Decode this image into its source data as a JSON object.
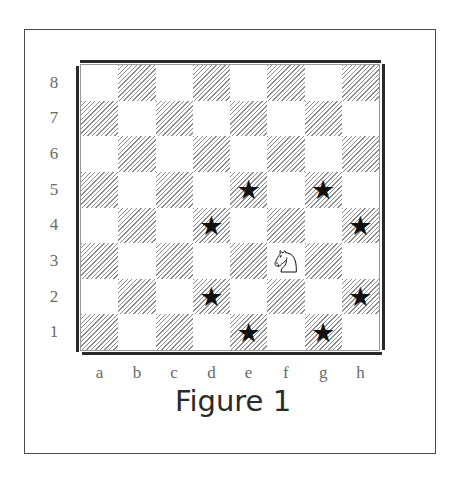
{
  "diagram": {
    "type": "chessboard",
    "caption": "Figure 1",
    "ranks": [
      "8",
      "7",
      "6",
      "5",
      "4",
      "3",
      "2",
      "1"
    ],
    "files": [
      "a",
      "b",
      "c",
      "d",
      "e",
      "f",
      "g",
      "h"
    ],
    "pieces": [
      {
        "square": "f3",
        "piece": "knight",
        "color": "white",
        "glyph": "knight-icon"
      }
    ],
    "markers": [
      {
        "square": "e5",
        "symbol": "★"
      },
      {
        "square": "g5",
        "symbol": "★"
      },
      {
        "square": "d4",
        "symbol": "★"
      },
      {
        "square": "h4",
        "symbol": "★"
      },
      {
        "square": "d2",
        "symbol": "★"
      },
      {
        "square": "h2",
        "symbol": "★"
      },
      {
        "square": "e1",
        "symbol": "★"
      },
      {
        "square": "g1",
        "symbol": "★"
      }
    ],
    "colors": {
      "dark_square_hatch": "#8c8c8c",
      "light_square": "#ffffff",
      "marker": "#111111",
      "label": "#6a6a6a",
      "frame": "#4a4a4a"
    }
  }
}
